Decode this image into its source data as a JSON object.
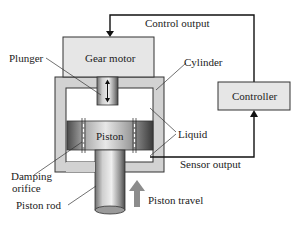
{
  "diagram": {
    "title": "",
    "labels": {
      "control_output": "Control output",
      "gear_motor": "Gear motor",
      "plunger": "Plunger",
      "cylinder": "Cylinder",
      "controller": "Controller",
      "piston": "Piston",
      "liquid": "Liquid",
      "damping_orifice_line1": "Damping",
      "damping_orifice_line2": "orifice",
      "sensor_output": "Sensor output",
      "piston_rod": "Piston rod",
      "piston_travel": "Piston travel"
    },
    "colors": {
      "box_fill": "#e6e6e6",
      "cylinder_wall": "#d2d2d2",
      "line": "#111111",
      "arrow_gray": "#8c8c8c",
      "liquid": "#ffffff"
    }
  }
}
